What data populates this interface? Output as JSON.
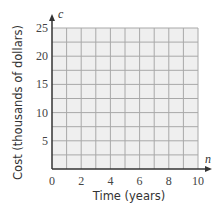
{
  "chart_data": {
    "type": "line",
    "title": "",
    "xlabel": "Time (years)",
    "ylabel": "Cost (thousands of dollars)",
    "x_var": "n",
    "y_var": "c",
    "xlim": [
      0,
      10
    ],
    "ylim": [
      0,
      25
    ],
    "x_ticks": [
      0,
      2,
      4,
      6,
      8,
      10
    ],
    "y_ticks": [
      5,
      10,
      15,
      20,
      25
    ],
    "x_grid_step": 1,
    "y_grid_step": 2.5,
    "grid": true,
    "series": []
  },
  "colors": {
    "grid_fill": "#efefef",
    "grid_line": "#a8a8a8",
    "axis": "#333333"
  }
}
